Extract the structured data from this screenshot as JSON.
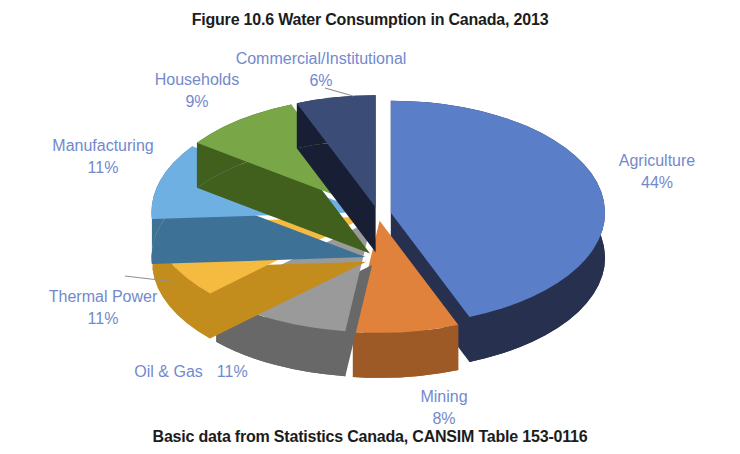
{
  "chart_data": {
    "type": "pie",
    "style": "3d-exploded",
    "title": "Figure 10.6 Water Consumption in Canada, 2013",
    "source_note": "Basic data from Statistics Canada, CANSIM Table 153-0116",
    "start_angle_deg": 0,
    "direction": "clockwise",
    "units": "%",
    "label_color": "#7289cc",
    "title_color": "#1c1c1c",
    "leader_line_color": "#8f8f8f",
    "slices": [
      {
        "label": "Agriculture",
        "value": 44,
        "pct_label": "44%",
        "color": "#5b7ec9",
        "side_color": "#27314f"
      },
      {
        "label": "Mining",
        "value": 8,
        "pct_label": "8%",
        "color": "#e0813c",
        "side_color": "#9d5a26"
      },
      {
        "label": "Oil & Gas",
        "value": 11,
        "pct_label": "11%",
        "color": "#9a9a9a",
        "side_color": "#686868"
      },
      {
        "label": "Thermal Power",
        "value": 11,
        "pct_label": "11%",
        "color": "#f5ba40",
        "side_color": "#c38d1e"
      },
      {
        "label": "Manufacturing",
        "value": 11,
        "pct_label": "11%",
        "color": "#6fb0e3",
        "side_color": "#3d7296"
      },
      {
        "label": "Households",
        "value": 9,
        "pct_label": "9%",
        "color": "#79a748",
        "side_color": "#42601d"
      },
      {
        "label": "Commercial/Institutional",
        "value": 6,
        "pct_label": "6%",
        "color": "#3b4d77",
        "side_color": "#181f35"
      }
    ]
  }
}
